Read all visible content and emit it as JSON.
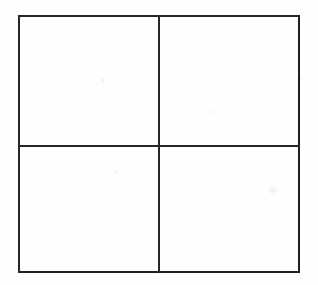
{
  "figure": {
    "canvas": {
      "width": 318,
      "height": 285,
      "background_color": "#FEFEFE"
    },
    "stroke": {
      "color": "#232323",
      "width_px": 2,
      "style": "solid"
    },
    "frame": {
      "left": 18,
      "top": 15,
      "right": 298,
      "bottom": 271,
      "width": 280,
      "height": 256
    },
    "dividers": {
      "vertical_x": 158,
      "horizontal_y": 145
    },
    "cells": [
      {
        "id": "cell-top-left",
        "label": "",
        "row": 1,
        "column": 1,
        "left": 18,
        "top": 15,
        "width": 140,
        "height": 130
      },
      {
        "id": "cell-top-right",
        "label": "",
        "row": 1,
        "column": 2,
        "left": 158,
        "top": 15,
        "width": 140,
        "height": 130
      },
      {
        "id": "cell-bottom-left",
        "label": "",
        "row": 2,
        "column": 1,
        "left": 18,
        "top": 145,
        "width": 140,
        "height": 126
      },
      {
        "id": "cell-bottom-right",
        "label": "",
        "row": 2,
        "column": 2,
        "left": 158,
        "top": 145,
        "width": 140,
        "height": 126
      }
    ]
  }
}
